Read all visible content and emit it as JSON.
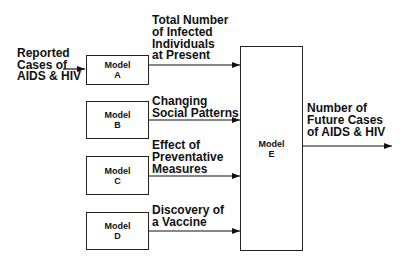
{
  "diagram": {
    "input": {
      "lines": [
        "Reported",
        "Cases of",
        "AIDS & HIV"
      ]
    },
    "models": [
      {
        "id": "A",
        "word": "Model",
        "letter": "A",
        "output": [
          "Total Number",
          "of Infected",
          "Individuals",
          "at Present"
        ]
      },
      {
        "id": "B",
        "word": "Model",
        "letter": "B",
        "output": [
          "Changing",
          "Social Patterns"
        ]
      },
      {
        "id": "C",
        "word": "Model",
        "letter": "C",
        "output": [
          "Effect of",
          "Preventative",
          "Measures"
        ]
      },
      {
        "id": "D",
        "word": "Model",
        "letter": "D",
        "output": [
          "Discovery of",
          "a Vaccine"
        ]
      }
    ],
    "final_model": {
      "id": "E",
      "word": "Model",
      "letter": "E"
    },
    "final_output": {
      "lines": [
        "Number of",
        "Future Cases",
        "of AIDS & HIV"
      ]
    }
  }
}
